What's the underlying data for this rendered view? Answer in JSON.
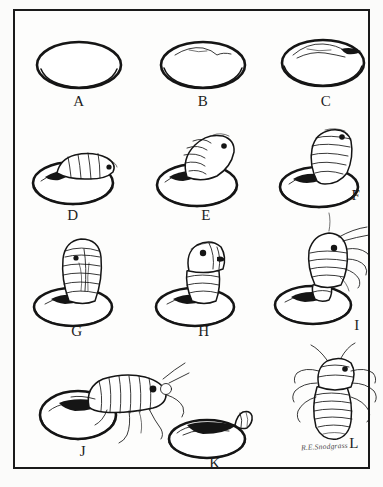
{
  "plate": {
    "title": "Insect egg hatching sequence plate",
    "signature": "R.E.Snodgrass",
    "background_color": "#fbfbfa",
    "ink_color": "#151515",
    "border_color": "#1a1a1a"
  },
  "figures": [
    {
      "id": "A",
      "caption": "A",
      "stage": "intact-egg",
      "description": "Plain unhatched egg, smooth ellipse, no markings"
    },
    {
      "id": "B",
      "caption": "B",
      "stage": "egg-splitting",
      "description": "Egg with thin split line beginning across upper surface"
    },
    {
      "id": "C",
      "caption": "C",
      "stage": "egg-cap-opening",
      "description": "Egg with split widened, shell cap lifting, dark rim"
    },
    {
      "id": "D",
      "caption": "D",
      "stage": "pronymph-emerging-low",
      "description": "Segmented pronymph head just pushing out of split eggshell"
    },
    {
      "id": "E",
      "caption": "E",
      "stage": "pronymph-emerging-mid",
      "description": "Pronymph body about half out of egg, tilted forward, eye spot visible"
    },
    {
      "id": "F",
      "caption": "F",
      "stage": "pronymph-emerging-upright",
      "description": "Pronymph standing nearly upright out of the egg, segments banded"
    },
    {
      "id": "G",
      "caption": "G",
      "stage": "pronymph-cuticle-splitting",
      "description": "Upright pronymph with dorsal cuticle line splitting along the back"
    },
    {
      "id": "H",
      "caption": "H",
      "stage": "nymph-head-free",
      "description": "Nymph head and thorax freeing from the pronymphal cuticle"
    },
    {
      "id": "I",
      "caption": "I",
      "stage": "nymph-legs-free",
      "description": "Nymph with legs and antennae pulled free, abdomen still in cuticle on egg"
    },
    {
      "id": "J",
      "caption": "J",
      "stage": "nymph-walking-away",
      "description": "Fully emerged nymph walking away from the empty eggshell"
    },
    {
      "id": "K",
      "caption": "K",
      "stage": "empty-eggshell",
      "description": "Empty eggshell with shed pronymphal cuticle remnant at the split"
    },
    {
      "id": "L",
      "caption": "L",
      "stage": "free-nymph-dorsal",
      "description": "Free first-instar nymph, dorsal view, six legs and antennae"
    }
  ]
}
